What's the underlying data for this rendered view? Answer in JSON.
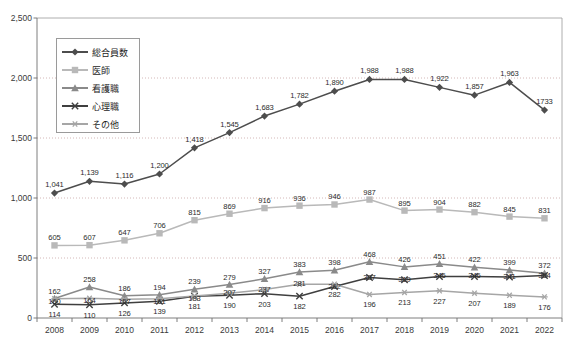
{
  "chart_data": {
    "type": "line",
    "title": "",
    "xlabel": "",
    "ylabel": "",
    "grid": true,
    "legend_position": "top-left-inside",
    "ylim": [
      0,
      2500
    ],
    "yticks": [
      "0",
      "500",
      "1,000",
      "1,500",
      "2,000",
      "2,500"
    ],
    "categories": [
      "2008",
      "2009",
      "2010",
      "2011",
      "2012",
      "2013",
      "2014",
      "2015",
      "2016",
      "2017",
      "2018",
      "2019",
      "2020",
      "2021",
      "2022"
    ],
    "series": [
      {
        "name": "総合員数",
        "color": "#4d4d4d",
        "marker": "diamond",
        "values": [
          1041,
          1139,
          1116,
          1200,
          1418,
          1545,
          1683,
          1782,
          1890,
          1988,
          1988,
          1922,
          1857,
          1963,
          1733
        ],
        "labels": [
          "1,041",
          "1,139",
          "1,116",
          "1,200",
          "1,418",
          "1,545",
          "1,683",
          "1,782",
          "1,890",
          "1,988",
          "1,988",
          "1,922",
          "1,857",
          "1,963",
          "1733"
        ]
      },
      {
        "name": "医師",
        "color": "#b9b9b9",
        "marker": "square",
        "values": [
          605,
          607,
          647,
          706,
          815,
          869,
          916,
          936,
          946,
          987,
          895,
          904,
          882,
          845,
          831
        ],
        "labels": [
          "605",
          "607",
          "647",
          "706",
          "815",
          "869",
          "916",
          "936",
          "946",
          "987",
          "895",
          "904",
          "882",
          "845",
          "831"
        ]
      },
      {
        "name": "看護職",
        "color": "#8a8a8a",
        "marker": "triangle",
        "values": [
          162,
          258,
          186,
          194,
          239,
          279,
          327,
          383,
          398,
          468,
          426,
          451,
          422,
          399,
          372
        ],
        "labels": [
          "162",
          "258",
          "186",
          "194",
          "239",
          "279",
          "327",
          "383",
          "398",
          "468",
          "426",
          "451",
          "422",
          "399",
          "372"
        ]
      },
      {
        "name": "心理職",
        "color": "#3f3f3f",
        "marker": "cross",
        "values": [
          114,
          110,
          126,
          139,
          181,
          190,
          203,
          182,
          262,
          337,
          319,
          346,
          346,
          341,
          354
        ],
        "labels": [
          "114",
          "110",
          "126",
          "139",
          "181",
          "190",
          "203",
          "182",
          "262",
          "337",
          "319",
          "346",
          "346",
          "341",
          "354"
        ]
      },
      {
        "name": "その他",
        "color": "#a6a6a6",
        "marker": "star",
        "values": [
          160,
          164,
          157,
          161,
          183,
          207,
          237,
          281,
          282,
          196,
          213,
          227,
          207,
          189,
          176
        ],
        "labels": [
          "160",
          "164",
          "157",
          "161",
          "183",
          "207",
          "237",
          "281",
          "282",
          "196",
          "213",
          "227",
          "207",
          "189",
          "176"
        ]
      }
    ]
  },
  "legend": {
    "items": [
      {
        "label": "総合員数"
      },
      {
        "label": "医師"
      },
      {
        "label": "看護職"
      },
      {
        "label": "心理職"
      },
      {
        "label": "その他"
      }
    ]
  }
}
